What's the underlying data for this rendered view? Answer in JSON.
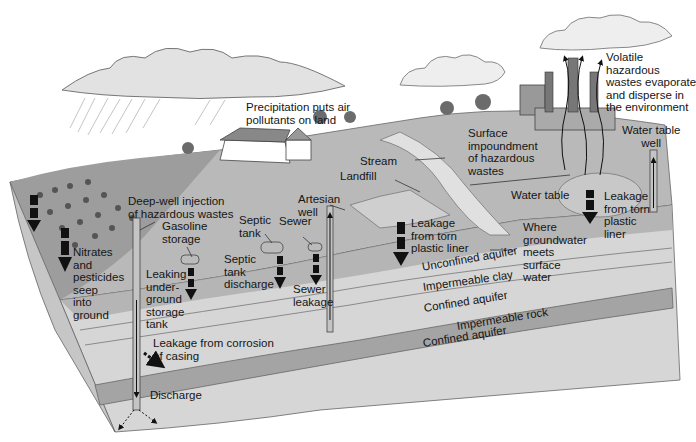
{
  "diagram": {
    "type": "cross-section",
    "colors": {
      "sky": "#ffffff",
      "surface": "#b9b9b9",
      "surface_dark": "#9a9a9a",
      "unconfined": "#d2d2d2",
      "clay": "#bfbfbf",
      "confined": "#d8d8d8",
      "rock": "#a6a6a6",
      "arrow": "#111111",
      "cloud": "#e6e6e6"
    }
  },
  "labels": {
    "precipitation": "Precipitation puts air\npollutants on land",
    "volatile": "Volatile\nhazardous\nwastes evaporate\nand disperse in\nthe environment",
    "surface_impoundment": "Surface\nimpoundment\nof hazardous\nwastes",
    "water_table_well": "Water table\nwell",
    "stream": "Stream",
    "landfill": "Landfill",
    "deep_well": "Deep-well injection\nof hazardous wastes",
    "gasoline_storage": "Gasoline\nstorage",
    "septic_tank": "Septic\ntank",
    "sewer": "Sewer",
    "artesian_well": "Artesian\nwell",
    "nitrates": "Nitrates\nand\npesticides\nseep\ninto\nground",
    "leaking_tank": "Leaking\nunder-\nground\nstorage\ntank",
    "septic_discharge": "Septic\ntank\ndischarge",
    "sewer_leakage": "Sewer\nleakage",
    "landfill_leakage": "Leakage\nfrom torn\nplastic liner",
    "impoundment_leakage": "Leakage\nfrom torn\nplastic\nliner",
    "water_table": "Water table",
    "where_groundwater": "Where\ngroundwater\nmeets\nsurface\nwater",
    "unconfined_aquifer": "Unconfined aquifer",
    "impermeable_clay": "Impermeable clay",
    "confined_aquifer_upper": "Confined aquifer",
    "impermeable_rock": "Impermeable rock",
    "confined_aquifer_lower": "Confined aquifer",
    "corrosion": "Leakage from corrosion\nof casing",
    "discharge": "Discharge"
  }
}
